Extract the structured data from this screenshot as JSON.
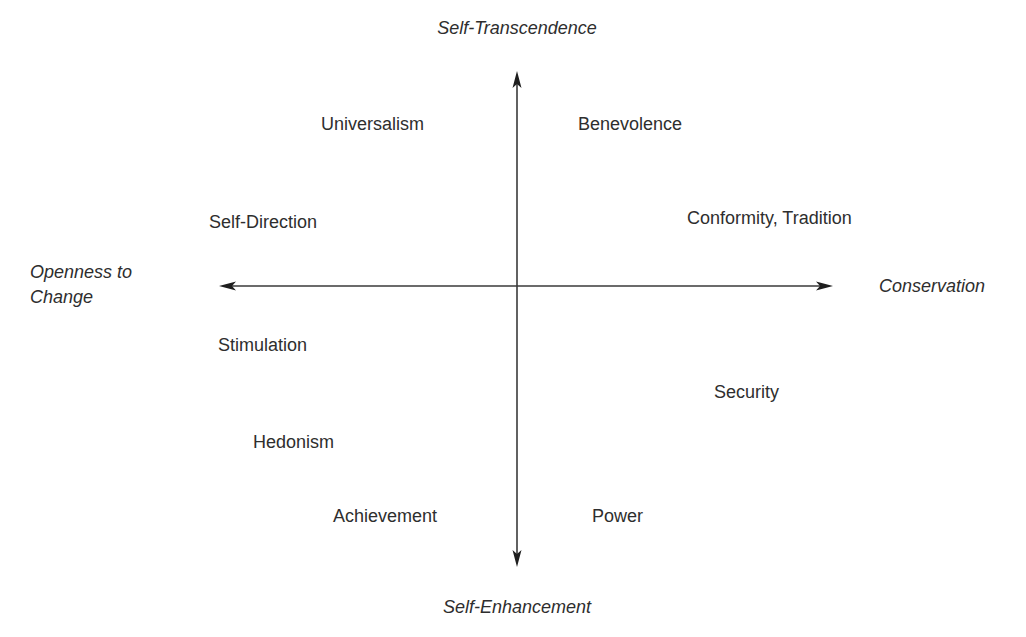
{
  "diagram": {
    "type": "quadrant-axes",
    "colors": {
      "background": "#ffffff",
      "text": "#2e2e2e",
      "axis": "#3a3a3a"
    },
    "axes": {
      "vertical": {
        "top_label": "Self-Transcendence",
        "bottom_label": "Self-Enhancement"
      },
      "horizontal": {
        "left_label_line1": "Openness to",
        "left_label_line2": "Change",
        "right_label": "Conservation"
      }
    },
    "values": [
      {
        "id": "universalism",
        "label": "Universalism",
        "quadrant": "top-left"
      },
      {
        "id": "benevolence",
        "label": "Benevolence",
        "quadrant": "top-right"
      },
      {
        "id": "self-direction",
        "label": "Self-Direction",
        "quadrant": "top-left"
      },
      {
        "id": "conformity-tradition",
        "label": "Conformity, Tradition",
        "quadrant": "top-right"
      },
      {
        "id": "stimulation",
        "label": "Stimulation",
        "quadrant": "bottom-left"
      },
      {
        "id": "security",
        "label": "Security",
        "quadrant": "bottom-right"
      },
      {
        "id": "hedonism",
        "label": "Hedonism",
        "quadrant": "bottom-left"
      },
      {
        "id": "achievement",
        "label": "Achievement",
        "quadrant": "bottom-left"
      },
      {
        "id": "power",
        "label": "Power",
        "quadrant": "bottom-right"
      }
    ]
  }
}
